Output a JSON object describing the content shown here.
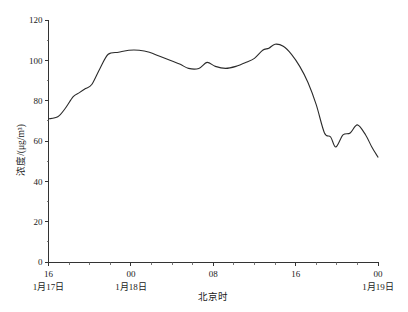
{
  "chart_data": {
    "type": "line",
    "title": "",
    "xlabel": "北京时",
    "ylabel": "浓度/(μg/m³)",
    "ylim": [
      0,
      120
    ],
    "ytick_values": [
      0,
      20,
      40,
      60,
      80,
      100,
      120
    ],
    "ytick_labels": [
      "0",
      "20",
      "40",
      "60",
      "80",
      "100",
      "120"
    ],
    "xlim": [
      16,
      48
    ],
    "xtick_values": [
      16,
      24,
      32,
      40,
      48
    ],
    "xtick_labels": [
      "16",
      "00",
      "08",
      "16",
      "00"
    ],
    "x_minor_step": 2,
    "grid": false,
    "legend": null,
    "date_labels": [
      {
        "text": "1月17日",
        "at_hour": 16
      },
      {
        "text": "1月18日",
        "at_hour": 24
      },
      {
        "text": "1月19日",
        "at_hour": 48
      }
    ],
    "series": [
      {
        "name": "浓度",
        "x": [
          16,
          17,
          18,
          19,
          20,
          21,
          22,
          23,
          24,
          25,
          26,
          27,
          28,
          29,
          30,
          31,
          32,
          33,
          34,
          35,
          36,
          37,
          38,
          39,
          40,
          41,
          42,
          43,
          44,
          45,
          46,
          47,
          48
        ],
        "values": [
          71,
          72,
          76,
          82,
          85,
          88,
          96,
          103,
          104,
          105,
          105,
          104,
          102,
          100,
          98,
          97,
          98,
          97,
          96,
          97,
          99,
          102,
          106,
          108,
          107,
          103,
          97,
          88,
          76,
          63,
          58,
          63,
          64
        ],
        "values_note": "hourly PM concentration"
      }
    ],
    "series_points": [
      {
        "h": 16.0,
        "v": 71
      },
      {
        "h": 16.9,
        "v": 72
      },
      {
        "h": 17.6,
        "v": 76
      },
      {
        "h": 18.4,
        "v": 82
      },
      {
        "h": 19.0,
        "v": 84
      },
      {
        "h": 19.6,
        "v": 86
      },
      {
        "h": 20.2,
        "v": 88
      },
      {
        "h": 21.0,
        "v": 96
      },
      {
        "h": 21.8,
        "v": 103
      },
      {
        "h": 22.8,
        "v": 104
      },
      {
        "h": 23.8,
        "v": 105
      },
      {
        "h": 24.8,
        "v": 105
      },
      {
        "h": 25.8,
        "v": 104
      },
      {
        "h": 26.8,
        "v": 102
      },
      {
        "h": 27.8,
        "v": 100
      },
      {
        "h": 28.8,
        "v": 98
      },
      {
        "h": 29.6,
        "v": 96
      },
      {
        "h": 30.6,
        "v": 96
      },
      {
        "h": 31.4,
        "v": 99
      },
      {
        "h": 32.2,
        "v": 97
      },
      {
        "h": 33.2,
        "v": 96
      },
      {
        "h": 34.2,
        "v": 97
      },
      {
        "h": 35.2,
        "v": 99
      },
      {
        "h": 36.0,
        "v": 101
      },
      {
        "h": 36.8,
        "v": 105
      },
      {
        "h": 37.4,
        "v": 106
      },
      {
        "h": 38.0,
        "v": 108
      },
      {
        "h": 38.8,
        "v": 107
      },
      {
        "h": 39.6,
        "v": 103
      },
      {
        "h": 40.4,
        "v": 97
      },
      {
        "h": 41.2,
        "v": 89
      },
      {
        "h": 42.0,
        "v": 78
      },
      {
        "h": 42.8,
        "v": 64
      },
      {
        "h": 43.4,
        "v": 62
      },
      {
        "h": 43.9,
        "v": 57
      },
      {
        "h": 44.6,
        "v": 63
      },
      {
        "h": 45.3,
        "v": 64
      },
      {
        "h": 46.0,
        "v": 68
      },
      {
        "h": 46.8,
        "v": 63
      },
      {
        "h": 47.4,
        "v": 57
      },
      {
        "h": 48.0,
        "v": 52
      }
    ]
  },
  "figure": {
    "background_color": "#ffffff",
    "line_color": "#2b2b2b",
    "axis_color": "#333333"
  }
}
